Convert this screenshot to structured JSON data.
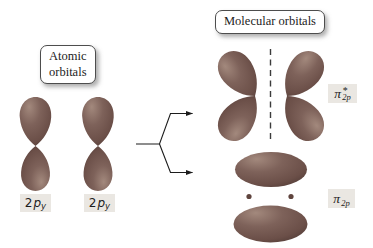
{
  "boxes": {
    "atomic": {
      "line1": "Atomic",
      "line2": "orbitals"
    },
    "molecular": {
      "label": "Molecular orbitals"
    }
  },
  "orbital_labels": {
    "ao1": {
      "coeff": "2",
      "letter": "p",
      "sub": "y"
    },
    "ao2": {
      "coeff": "2",
      "letter": "p",
      "sub": "y"
    },
    "pi_star": {
      "symbol": "π",
      "star": "*",
      "sub": "2p"
    },
    "pi_bonding": {
      "symbol": "π",
      "sub": "2p"
    }
  },
  "diagram": {
    "atomic_orbital_count": 2,
    "molecular_orbitals": [
      "pi-star antibonding (two tilted lobed orbitals with vertical dashed nodal plane)",
      "pi bonding (two horizontal ellipses with two nucleus dots between)"
    ],
    "nuclei_dots": 2
  },
  "colors": {
    "background": "#ffffff",
    "orbital_highlight": "#a3897d",
    "orbital_mid": "#7e625a",
    "orbital_deep": "#6b4f48",
    "orbital_edge": "#523c37",
    "nucleus_dot": "#5f443e",
    "chip_bg": "#eae7e2",
    "arrow_line": "#1c1c1c",
    "dash_line": "#3c3c3c"
  }
}
